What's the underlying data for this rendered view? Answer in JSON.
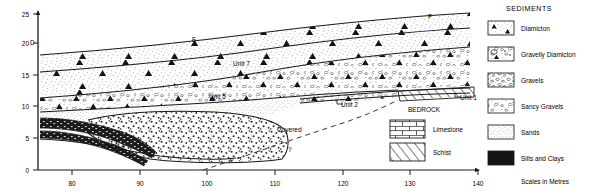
{
  "figure": {
    "type": "geological-cross-section",
    "axes": {
      "x": {
        "label": "",
        "ticks": [
          80,
          90,
          100,
          110,
          120,
          130,
          140
        ],
        "range": [
          75,
          140
        ],
        "tick_labels": [
          "80",
          "90",
          "100",
          "110",
          "120",
          "130",
          "140"
        ]
      },
      "y": {
        "label": "",
        "ticks": [
          0,
          5,
          10,
          15,
          20,
          25
        ],
        "range": [
          0,
          25
        ],
        "tick_labels": [
          "0",
          "5",
          "10",
          "15",
          "20",
          "25"
        ]
      },
      "scale_note": "Scales in Metres"
    },
    "section_labels": [
      {
        "text": "D",
        "x": 30,
        "y": 45
      },
      {
        "text": "E",
        "x": 192,
        "y": 42
      },
      {
        "text": "F",
        "x": 428,
        "y": 19
      },
      {
        "text": "Unit 7",
        "x": 233,
        "y": 66
      },
      {
        "text": "Unit 5",
        "x": 209,
        "y": 99
      },
      {
        "text": "Unit 4",
        "x": 108,
        "y": 148
      },
      {
        "text": "Unit 2",
        "x": 341,
        "y": 104
      },
      {
        "text": "Unit 1",
        "x": 458,
        "y": 97
      },
      {
        "text": "BEDROCK",
        "x": 408,
        "y": 110
      },
      {
        "text": "Covered",
        "x": 277,
        "y": 130
      },
      {
        "text": "?",
        "x": 288,
        "y": 150
      }
    ],
    "bedrock_legend": {
      "items": [
        {
          "label": "Limestone",
          "pattern": "brick"
        },
        {
          "label": "Schist",
          "pattern": "hatch"
        }
      ]
    },
    "sediments_legend": {
      "title": "SEDIMENTS",
      "items": [
        {
          "label": "Diamicton",
          "pattern": "diamicton"
        },
        {
          "label": "Gravelly Diamicton",
          "pattern": "gravelly-diamicton"
        },
        {
          "label": "Gravels",
          "pattern": "gravels"
        },
        {
          "label": "Sancy Gravels",
          "pattern": "sandy-gravels"
        },
        {
          "label": "Sands",
          "pattern": "sands"
        },
        {
          "label": "Silts and Clays",
          "pattern": "silts-clays"
        }
      ]
    },
    "colors": {
      "ink": "#1a1a1a",
      "stipple": "#555555",
      "dark_fill": "#151515"
    }
  }
}
